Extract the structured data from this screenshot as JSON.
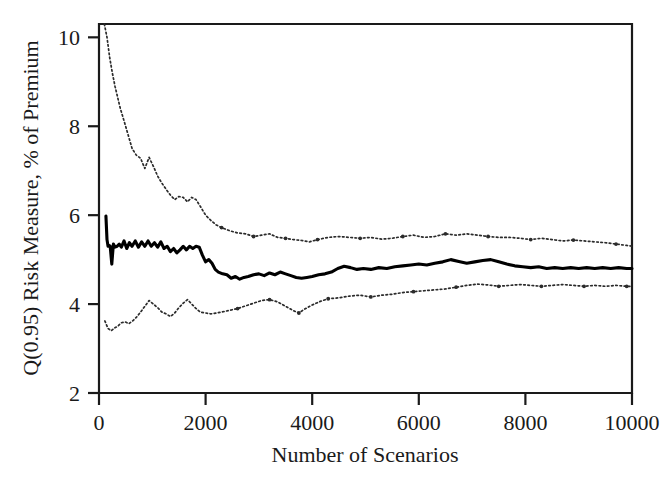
{
  "chart_data": {
    "type": "line",
    "title": "",
    "xlabel": "Number of Scenarios",
    "ylabel": "Q(0.95) Risk Measure, % of Premium",
    "xlim": [
      0,
      10000
    ],
    "ylim": [
      2,
      10.3
    ],
    "grid": false,
    "legend": "none",
    "xticks": [
      0,
      2000,
      4000,
      6000,
      8000,
      10000
    ],
    "xtick_labels": [
      "0",
      "2000",
      "4000",
      "6000",
      "8000",
      "10000"
    ],
    "yticks": [
      2,
      4,
      6,
      8,
      10
    ],
    "ytick_labels": [
      "2",
      "4",
      "6",
      "8",
      "10"
    ],
    "series": [
      {
        "name": "Upper confidence bound",
        "style": "dotted",
        "color": "#2b2b2b",
        "x": [
          100,
          150,
          200,
          250,
          300,
          350,
          400,
          450,
          500,
          560,
          620,
          700,
          780,
          860,
          940,
          1020,
          1100,
          1180,
          1260,
          1340,
          1420,
          1500,
          1580,
          1660,
          1740,
          1820,
          1900,
          2000,
          2100,
          2200,
          2300,
          2450,
          2600,
          2750,
          2900,
          3050,
          3200,
          3350,
          3500,
          3650,
          3800,
          3950,
          4100,
          4300,
          4500,
          4700,
          4900,
          5100,
          5300,
          5500,
          5700,
          5900,
          6100,
          6300,
          6500,
          6700,
          6900,
          7100,
          7300,
          7500,
          7700,
          7900,
          8100,
          8300,
          8500,
          8700,
          8900,
          9100,
          9300,
          9500,
          9700,
          9900,
          10000
        ],
        "y": [
          10.3,
          10.0,
          9.55,
          9.2,
          8.9,
          8.65,
          8.4,
          8.2,
          8.0,
          7.75,
          7.5,
          7.35,
          7.28,
          7.05,
          7.3,
          7.1,
          6.88,
          6.72,
          6.58,
          6.45,
          6.35,
          6.42,
          6.4,
          6.3,
          6.4,
          6.35,
          6.2,
          6.0,
          5.88,
          5.78,
          5.72,
          5.65,
          5.6,
          5.58,
          5.52,
          5.55,
          5.58,
          5.5,
          5.48,
          5.45,
          5.43,
          5.4,
          5.45,
          5.5,
          5.52,
          5.5,
          5.48,
          5.5,
          5.46,
          5.48,
          5.52,
          5.55,
          5.5,
          5.52,
          5.58,
          5.55,
          5.58,
          5.55,
          5.52,
          5.5,
          5.5,
          5.48,
          5.45,
          5.48,
          5.45,
          5.42,
          5.44,
          5.42,
          5.4,
          5.38,
          5.35,
          5.32,
          5.3
        ]
      },
      {
        "name": "Estimated risk measure",
        "style": "solid",
        "color": "#000000",
        "x": [
          130,
          150,
          170,
          190,
          210,
          240,
          270,
          300,
          340,
          380,
          420,
          470,
          520,
          570,
          620,
          680,
          740,
          800,
          860,
          920,
          980,
          1040,
          1100,
          1160,
          1220,
          1280,
          1340,
          1400,
          1460,
          1520,
          1580,
          1640,
          1700,
          1760,
          1820,
          1880,
          1940,
          2000,
          2060,
          2120,
          2180,
          2240,
          2320,
          2400,
          2480,
          2560,
          2640,
          2720,
          2800,
          2900,
          3000,
          3100,
          3200,
          3300,
          3400,
          3500,
          3600,
          3700,
          3800,
          3900,
          4000,
          4120,
          4240,
          4360,
          4480,
          4600,
          4720,
          4840,
          4960,
          5100,
          5250,
          5400,
          5550,
          5700,
          5850,
          6000,
          6150,
          6300,
          6450,
          6600,
          6750,
          6900,
          7050,
          7200,
          7350,
          7500,
          7650,
          7800,
          7950,
          8100,
          8250,
          8400,
          8550,
          8700,
          8850,
          9000,
          9150,
          9300,
          9450,
          9600,
          9750,
          9900,
          10000
        ],
        "y": [
          5.98,
          5.45,
          5.3,
          5.32,
          5.3,
          4.9,
          5.35,
          5.28,
          5.3,
          5.35,
          5.28,
          5.42,
          5.25,
          5.38,
          5.3,
          5.42,
          5.28,
          5.4,
          5.3,
          5.42,
          5.3,
          5.38,
          5.28,
          5.4,
          5.25,
          5.3,
          5.18,
          5.25,
          5.15,
          5.22,
          5.3,
          5.22,
          5.3,
          5.25,
          5.3,
          5.28,
          5.1,
          4.95,
          5.0,
          4.92,
          4.78,
          4.72,
          4.68,
          4.66,
          4.58,
          4.62,
          4.56,
          4.6,
          4.62,
          4.66,
          4.68,
          4.64,
          4.7,
          4.66,
          4.72,
          4.68,
          4.64,
          4.6,
          4.58,
          4.6,
          4.62,
          4.66,
          4.68,
          4.72,
          4.8,
          4.85,
          4.82,
          4.78,
          4.8,
          4.78,
          4.82,
          4.8,
          4.84,
          4.86,
          4.88,
          4.9,
          4.88,
          4.92,
          4.95,
          5.0,
          4.96,
          4.92,
          4.95,
          4.98,
          5.0,
          4.95,
          4.9,
          4.86,
          4.84,
          4.82,
          4.84,
          4.8,
          4.82,
          4.8,
          4.82,
          4.8,
          4.82,
          4.8,
          4.82,
          4.8,
          4.82,
          4.8,
          4.8
        ]
      },
      {
        "name": "Lower confidence bound",
        "style": "dotted",
        "color": "#2b2b2b",
        "x": [
          110,
          170,
          230,
          290,
          350,
          420,
          490,
          560,
          630,
          700,
          780,
          860,
          940,
          1020,
          1100,
          1180,
          1260,
          1340,
          1420,
          1500,
          1580,
          1660,
          1740,
          1820,
          1900,
          2000,
          2100,
          2200,
          2300,
          2450,
          2600,
          2750,
          2900,
          3050,
          3200,
          3350,
          3500,
          3650,
          3750,
          3850,
          4000,
          4150,
          4300,
          4500,
          4700,
          4900,
          5100,
          5300,
          5500,
          5700,
          5900,
          6100,
          6300,
          6500,
          6700,
          6900,
          7100,
          7300,
          7500,
          7700,
          7900,
          8100,
          8300,
          8500,
          8700,
          8900,
          9100,
          9300,
          9500,
          9700,
          9900,
          10000
        ],
        "y": [
          3.62,
          3.45,
          3.4,
          3.46,
          3.5,
          3.58,
          3.6,
          3.56,
          3.62,
          3.7,
          3.82,
          3.95,
          4.08,
          4.0,
          3.92,
          3.82,
          3.78,
          3.72,
          3.8,
          3.92,
          4.02,
          4.1,
          4.0,
          3.9,
          3.82,
          3.8,
          3.78,
          3.8,
          3.82,
          3.86,
          3.9,
          3.96,
          4.02,
          4.08,
          4.1,
          4.05,
          3.95,
          3.85,
          3.8,
          3.88,
          3.98,
          4.06,
          4.12,
          4.14,
          4.18,
          4.2,
          4.16,
          4.2,
          4.22,
          4.26,
          4.28,
          4.3,
          4.32,
          4.34,
          4.38,
          4.42,
          4.45,
          4.43,
          4.4,
          4.42,
          4.44,
          4.42,
          4.4,
          4.42,
          4.44,
          4.42,
          4.4,
          4.42,
          4.4,
          4.42,
          4.4,
          4.4
        ]
      }
    ]
  },
  "axes": {
    "x_title": "Number of Scenarios",
    "y_title": "Q(0.95) Risk Measure, % of Premium"
  },
  "colors": {
    "frame": "#1a1a1a",
    "solid_series": "#000000",
    "dotted_series": "#2b2b2b",
    "background": "#ffffff"
  }
}
